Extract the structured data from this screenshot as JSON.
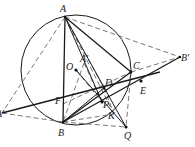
{
  "diagram": {
    "type": "geometry",
    "circle": {
      "center": "O",
      "cx": 76,
      "cy": 70,
      "r": 55
    },
    "points": [
      {
        "name": "A",
        "label": "A",
        "x": 65,
        "y": 17,
        "lx": 60,
        "ly": 12
      },
      {
        "name": "B",
        "label": "B",
        "x": 63,
        "y": 122,
        "lx": 58,
        "ly": 136
      },
      {
        "name": "C",
        "label": "C",
        "x": 131,
        "y": 72,
        "lx": 133,
        "ly": 69
      },
      {
        "name": "O",
        "label": "O",
        "x": 76,
        "y": 70,
        "lx": 66,
        "ly": 70
      },
      {
        "name": "A'",
        "label": "A'",
        "x": 84,
        "y": 63,
        "lx": 80,
        "ly": 62
      },
      {
        "name": "D",
        "label": "D",
        "x": 104,
        "y": 88,
        "lx": 105,
        "ly": 86
      },
      {
        "name": "P",
        "label": "P",
        "x": 102,
        "y": 102,
        "lx": 103,
        "ly": 108
      },
      {
        "name": "E",
        "label": "E",
        "x": 141,
        "y": 81,
        "lx": 140,
        "ly": 94
      },
      {
        "name": "F",
        "label": "F",
        "x": 63,
        "y": 104,
        "lx": 55,
        "ly": 104
      },
      {
        "name": "K",
        "label": "K",
        "x": 114,
        "y": 114,
        "lx": 108,
        "ly": 119
      },
      {
        "name": "Q",
        "label": "Q",
        "x": 126,
        "y": 127,
        "lx": 124,
        "ly": 139
      },
      {
        "name": "B'",
        "label": "B'",
        "x": 180,
        "y": 57,
        "lx": 181,
        "ly": 61
      },
      {
        "name": "A''",
        "label": "A'",
        "x": 2,
        "y": 113,
        "lx": -4,
        "ly": 117
      }
    ],
    "solid_segments": [
      [
        "A",
        "B"
      ],
      [
        "A",
        "C"
      ],
      [
        "A",
        "Q"
      ],
      [
        "B",
        "C"
      ],
      [
        "O",
        "Q"
      ],
      [
        "B",
        "B'"
      ],
      [
        "A''",
        "E"
      ],
      [
        "B",
        "D"
      ]
    ],
    "dashed_segments": [
      [
        "A",
        "B'"
      ],
      [
        "A",
        "A''"
      ],
      [
        "A''",
        "B"
      ],
      [
        "C",
        "B'"
      ],
      [
        "C",
        "Q"
      ],
      [
        "B",
        "Q"
      ],
      [
        "O",
        "P"
      ],
      [
        "A'",
        "P"
      ],
      [
        "F",
        "C"
      ],
      [
        "A'",
        "B"
      ]
    ]
  }
}
